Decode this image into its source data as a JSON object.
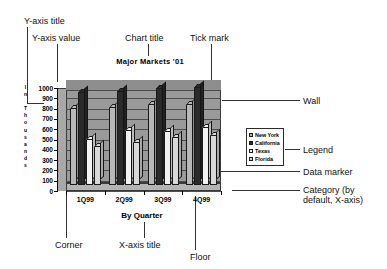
{
  "chart_data": {
    "type": "bar",
    "title": "Major Markets '01",
    "xlabel": "By Quarter",
    "ylabel": "In Thousands",
    "categories": [
      "1Q99",
      "2Q99",
      "3Q99",
      "4Q99"
    ],
    "ylim": [
      0,
      1000
    ],
    "yticks": [
      "1000",
      "900",
      "800",
      "700",
      "600",
      "500",
      "400",
      "300",
      "200",
      "100",
      "0"
    ],
    "grid": true,
    "legend_position": "right",
    "series": [
      {
        "name": "New York",
        "values": [
          750,
          760,
          790,
          790
        ],
        "color": "#b8b8b8"
      },
      {
        "name": "California",
        "values": [
          900,
          915,
          945,
          950
        ],
        "color": "#2a2a2a"
      },
      {
        "name": "Texas",
        "values": [
          450,
          530,
          520,
          560
        ],
        "color": "#f2f2f2"
      },
      {
        "name": "Florida",
        "values": [
          380,
          420,
          470,
          490
        ],
        "color": "#d8d8d8"
      }
    ]
  },
  "annotations": {
    "y_axis_title": "Y-axis title",
    "y_axis_value": "Y-axis value",
    "chart_title": "Chart title",
    "tick_mark": "Tick mark",
    "wall": "Wall",
    "legend": "Legend",
    "data_marker": "Data marker",
    "category": "Category (by\ndefault, X-axis)",
    "corner": "Corner",
    "x_axis_title": "X-axis title",
    "floor": "Floor"
  }
}
